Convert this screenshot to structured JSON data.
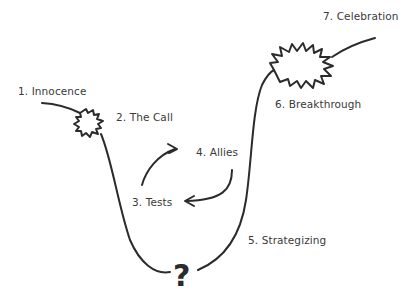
{
  "diagram": {
    "type": "journey-curve",
    "stroke_color": "#2b2b2b",
    "stages": [
      {
        "id": 1,
        "label": "1. Innocence"
      },
      {
        "id": 2,
        "label": "2. The Call"
      },
      {
        "id": 3,
        "label": "3. Tests"
      },
      {
        "id": 4,
        "label": "4. Allies"
      },
      {
        "id": 5,
        "label": "5. Strategizing"
      },
      {
        "id": 6,
        "label": "6. Breakthrough"
      },
      {
        "id": 7,
        "label": "7. Celebration"
      }
    ],
    "bottom_symbol": "?"
  }
}
